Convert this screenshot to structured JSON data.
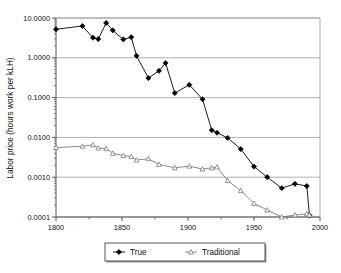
{
  "chart_data": {
    "type": "line",
    "title": "",
    "xlabel": "",
    "ylabel": "Labor price (hours work per kLH)",
    "xlim": [
      1800,
      2000
    ],
    "ylim": [
      0.0001,
      10.0
    ],
    "yscale": "log",
    "xscale": "linear",
    "grid": "horizontal-major-only",
    "legend_position": "bottom-center",
    "xticks": [
      1800,
      1850,
      1900,
      1950,
      2000
    ],
    "xticklabels": [
      "1800",
      "1850",
      "1900",
      "1950",
      "2000"
    ],
    "xminorticks": [
      1825,
      1875,
      1925,
      1975
    ],
    "yticks": [
      10.0,
      1.0,
      0.1,
      0.01,
      0.001,
      0.0001
    ],
    "yticklabels": [
      "10.0000",
      "1.0000",
      "0.1000",
      "0.0100",
      "0.0010",
      "0.0001"
    ],
    "series": [
      {
        "name": "True",
        "marker": "filled-diamond",
        "color": "#000000",
        "points": [
          [
            1800,
            5.2
          ],
          [
            1820,
            6.3
          ],
          [
            1828,
            3.2
          ],
          [
            1832,
            2.95
          ],
          [
            1838,
            7.5
          ],
          [
            1843,
            4.9
          ],
          [
            1851,
            2.9
          ],
          [
            1857,
            3.3
          ],
          [
            1861,
            1.12
          ],
          [
            1870,
            0.31
          ],
          [
            1878,
            0.47
          ],
          [
            1883,
            0.74
          ],
          [
            1890,
            0.13
          ],
          [
            1901,
            0.21
          ],
          [
            1911,
            0.091
          ],
          [
            1918,
            0.0152
          ],
          [
            1922,
            0.0131
          ],
          [
            1930,
            0.0097
          ],
          [
            1940,
            0.0051
          ],
          [
            1950,
            0.00185
          ],
          [
            1960,
            0.001
          ],
          [
            1971,
            0.00053
          ],
          [
            1981,
            0.00068
          ],
          [
            1990,
            0.0006
          ],
          [
            1992,
            0.00011
          ]
        ]
      },
      {
        "name": "Traditional",
        "marker": "open-triangle",
        "color": "#7a7a7a",
        "points": [
          [
            1800,
            0.00555
          ],
          [
            1820,
            0.006
          ],
          [
            1828,
            0.0065
          ],
          [
            1832,
            0.0054
          ],
          [
            1838,
            0.0052
          ],
          [
            1843,
            0.004
          ],
          [
            1851,
            0.0035
          ],
          [
            1857,
            0.0033
          ],
          [
            1861,
            0.0027
          ],
          [
            1870,
            0.0029
          ],
          [
            1878,
            0.0021
          ],
          [
            1890,
            0.00172
          ],
          [
            1901,
            0.0019
          ],
          [
            1911,
            0.0016
          ],
          [
            1918,
            0.00172
          ],
          [
            1922,
            0.0018
          ],
          [
            1930,
            0.00082
          ],
          [
            1940,
            0.00046
          ],
          [
            1950,
            0.00022
          ],
          [
            1960,
            0.00015
          ],
          [
            1971,
            0.0001
          ],
          [
            1981,
            0.000112
          ],
          [
            1990,
            0.00012
          ],
          [
            1992,
            0.000112
          ]
        ]
      }
    ]
  },
  "legend": {
    "items": [
      {
        "label": "True"
      },
      {
        "label": "Traditional"
      }
    ]
  },
  "colors": {
    "series_true": "#000000",
    "series_traditional": "#7a7a7a",
    "grid": "#9a9a9a",
    "axis": "#555555",
    "text": "#111111",
    "background": "#ffffff"
  }
}
